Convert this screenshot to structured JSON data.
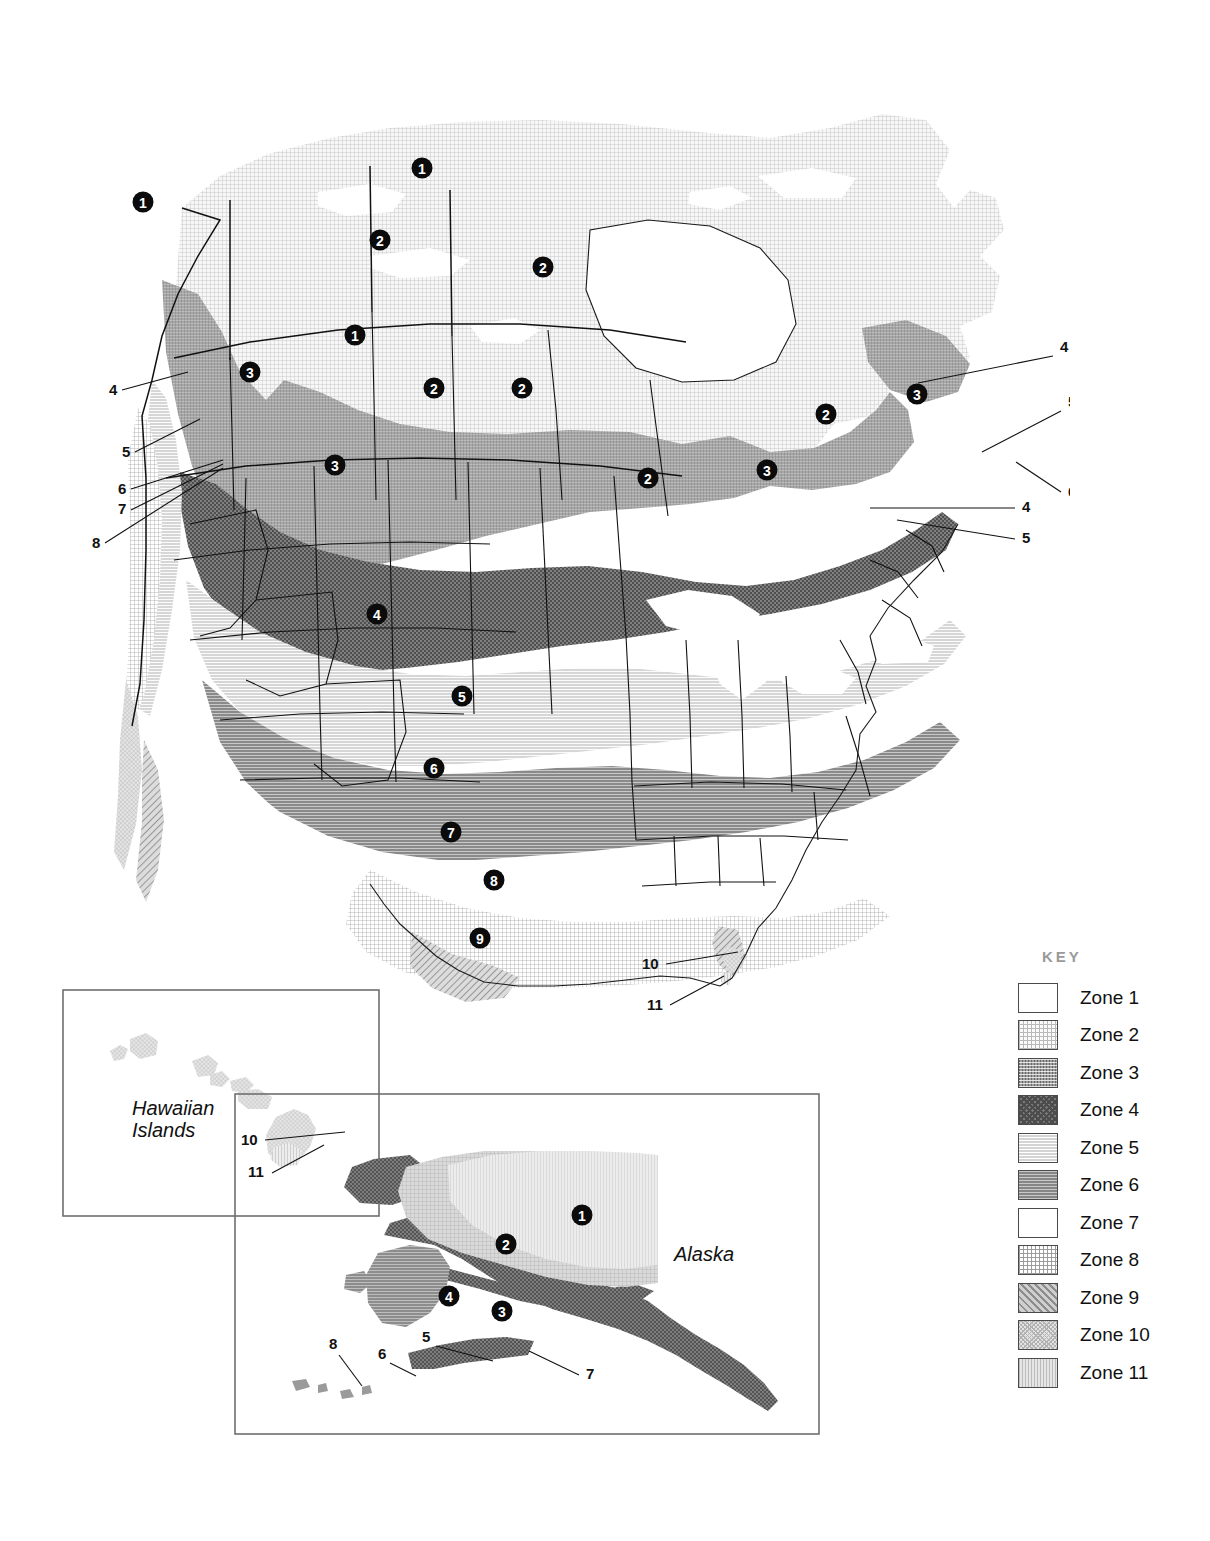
{
  "page": {
    "type": "hardiness-zone-map",
    "background": "#ffffff"
  },
  "key": {
    "title": "KEY",
    "title_color": "#9a9a9a",
    "items": [
      {
        "label": "Zone 1",
        "swatch": "zone-1-swatch",
        "zone": 1
      },
      {
        "label": "Zone 2",
        "swatch": "zone-2-swatch",
        "zone": 2
      },
      {
        "label": "Zone 3",
        "swatch": "zone-3-swatch",
        "zone": 3
      },
      {
        "label": "Zone 4",
        "swatch": "zone-4-swatch",
        "zone": 4
      },
      {
        "label": "Zone 5",
        "swatch": "zone-5-swatch",
        "zone": 5
      },
      {
        "label": "Zone 6",
        "swatch": "zone-6-swatch",
        "zone": 6
      },
      {
        "label": "Zone 7",
        "swatch": "zone-7-swatch",
        "zone": 7
      },
      {
        "label": "Zone 8",
        "swatch": "zone-8-swatch",
        "zone": 8
      },
      {
        "label": "Zone 9",
        "swatch": "zone-9-swatch",
        "zone": 9
      },
      {
        "label": "Zone 10",
        "swatch": "zone-10-swatch",
        "zone": 10
      },
      {
        "label": "Zone 11",
        "swatch": "zone-11-swatch",
        "zone": 11
      }
    ]
  },
  "main_map": {
    "name": "north-america-map",
    "zone_badges": [
      {
        "zone": "1",
        "x": 352,
        "y": 88
      },
      {
        "zone": "1",
        "x": 73,
        "y": 122
      },
      {
        "zone": "2",
        "x": 310,
        "y": 160
      },
      {
        "zone": "2",
        "x": 473,
        "y": 187
      },
      {
        "zone": "1",
        "x": 285,
        "y": 255
      },
      {
        "zone": "3",
        "x": 180,
        "y": 292
      },
      {
        "zone": "2",
        "x": 364,
        "y": 308
      },
      {
        "zone": "2",
        "x": 452,
        "y": 308
      },
      {
        "zone": "2",
        "x": 756,
        "y": 334
      },
      {
        "zone": "3",
        "x": 847,
        "y": 314
      },
      {
        "zone": "3",
        "x": 265,
        "y": 385
      },
      {
        "zone": "2",
        "x": 578,
        "y": 398
      },
      {
        "zone": "3",
        "x": 697,
        "y": 390
      },
      {
        "zone": "4",
        "x": 307,
        "y": 534
      },
      {
        "zone": "5",
        "x": 392,
        "y": 616
      },
      {
        "zone": "6",
        "x": 364,
        "y": 688
      },
      {
        "zone": "7",
        "x": 381,
        "y": 752
      },
      {
        "zone": "8",
        "x": 424,
        "y": 800
      },
      {
        "zone": "9",
        "x": 410,
        "y": 858
      }
    ],
    "leader_labels": [
      {
        "text": "4",
        "tx": 39,
        "ty": 315,
        "x1": 52,
        "y1": 310,
        "x2": 118,
        "y2": 292
      },
      {
        "text": "5",
        "tx": 52,
        "ty": 377,
        "x1": 65,
        "y1": 372,
        "x2": 130,
        "y2": 339
      },
      {
        "text": "6",
        "tx": 48,
        "ty": 414,
        "x1": 61,
        "y1": 409,
        "x2": 153,
        "y2": 380
      },
      {
        "text": "7",
        "tx": 48,
        "ty": 434,
        "x1": 61,
        "y1": 430,
        "x2": 153,
        "y2": 384
      },
      {
        "text": "8",
        "tx": 22,
        "ty": 468,
        "x1": 35,
        "y1": 463,
        "x2": 153,
        "y2": 388
      },
      {
        "text": "4",
        "tx": 990,
        "ty": 272,
        "x1": 983,
        "y1": 276,
        "x2": 848,
        "y2": 303
      },
      {
        "text": "5",
        "tx": 998,
        "ty": 327,
        "x1": 991,
        "y1": 331,
        "x2": 912,
        "y2": 372
      },
      {
        "text": "6",
        "tx": 998,
        "ty": 417,
        "x1": 991,
        "y1": 412,
        "x2": 946,
        "y2": 382
      },
      {
        "text": "4",
        "tx": 952,
        "ty": 432,
        "x1": 945,
        "y1": 428,
        "x2": 800,
        "y2": 428
      },
      {
        "text": "5",
        "tx": 952,
        "ty": 463,
        "x1": 945,
        "y1": 459,
        "x2": 827,
        "y2": 440
      },
      {
        "text": "10",
        "tx": 572,
        "ty": 889,
        "x1": 596,
        "y1": 884,
        "x2": 668,
        "y2": 872
      },
      {
        "text": "11",
        "tx": 577,
        "ty": 930,
        "x1": 600,
        "y1": 925,
        "x2": 654,
        "y2": 896
      }
    ]
  },
  "hawaii_inset": {
    "name": "hawaiian-islands-inset",
    "title": "Hawaiian\nIslands",
    "title_line1": "Hawaiian",
    "title_line2": "Islands",
    "leader_labels": [
      {
        "text": "10",
        "tx": 179,
        "ty": 156,
        "x1": 203,
        "y1": 151,
        "x2": 283,
        "y2": 143
      },
      {
        "text": "11",
        "tx": 186,
        "ty": 188,
        "x1": 210,
        "y1": 184,
        "x2": 262,
        "y2": 156
      }
    ]
  },
  "alaska_inset": {
    "name": "alaska-inset",
    "title": "Alaska",
    "zone_badges": [
      {
        "zone": "1",
        "x": 348,
        "y": 122
      },
      {
        "zone": "2",
        "x": 272,
        "y": 151
      },
      {
        "zone": "4",
        "x": 215,
        "y": 203
      },
      {
        "zone": "3",
        "x": 268,
        "y": 218
      }
    ],
    "leader_labels": [
      {
        "text": "8",
        "tx": 95,
        "ty": 256,
        "x1": 105,
        "y1": 262,
        "x2": 128,
        "y2": 293
      },
      {
        "text": "6",
        "tx": 144,
        "ty": 266,
        "x1": 156,
        "y1": 270,
        "x2": 182,
        "y2": 283
      },
      {
        "text": "5",
        "tx": 188,
        "ty": 249,
        "x1": 202,
        "y1": 253,
        "x2": 259,
        "y2": 268
      },
      {
        "text": "7",
        "tx": 352,
        "ty": 286,
        "x1": 345,
        "y1": 282,
        "x2": 295,
        "y2": 258
      }
    ]
  }
}
